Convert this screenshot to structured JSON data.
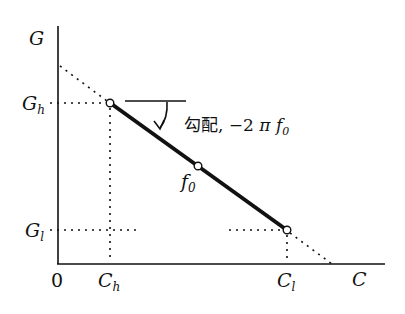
{
  "diagram": {
    "axes": {
      "y_label": "G",
      "x_label": "C",
      "origin_label": "0"
    },
    "points": {
      "high": {
        "g_label_main": "G",
        "g_label_sub": "h",
        "c_label_main": "C",
        "c_label_sub": "h"
      },
      "mid": {
        "label_main": "f",
        "label_sub": "0"
      },
      "low": {
        "g_label_main": "G",
        "g_label_sub": "l",
        "c_label_main": "C",
        "c_label_sub": "l"
      }
    },
    "slope_annotation": {
      "prefix": "勾配, −2",
      "pi": "π",
      "f_main": "f",
      "f_sub": "0"
    },
    "colors": {
      "ink": "#111111",
      "background": "#ffffff"
    }
  }
}
